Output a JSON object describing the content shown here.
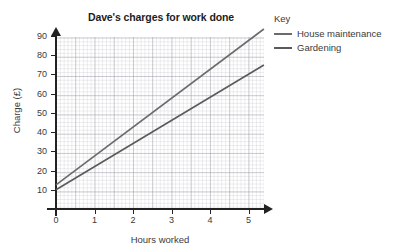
{
  "chart_data": {
    "type": "line",
    "title": "Dave's charges for work done",
    "xlabel": "Hours worked",
    "ylabel": "Charge (£)",
    "xlim": [
      0,
      5.4
    ],
    "ylim": [
      0,
      98
    ],
    "xticks": [
      "0",
      "1",
      "2",
      "3",
      "4",
      "5"
    ],
    "xtick_values": [
      0,
      1,
      2,
      3,
      4,
      5
    ],
    "yticks": [
      "10",
      "20",
      "30",
      "40",
      "50",
      "60",
      "70",
      "80",
      "90"
    ],
    "ytick_values": [
      10,
      20,
      30,
      40,
      50,
      60,
      70,
      80,
      90
    ],
    "grid": true,
    "grid_style": "graph-paper",
    "legend_position": "right",
    "series": [
      {
        "name": "House maintenance",
        "color": "#6b6b6b",
        "intercept": 12.5,
        "slope": 15.0,
        "points": [
          [
            0,
            12.5
          ],
          [
            5.4,
            93.5
          ]
        ]
      },
      {
        "name": "Gardening",
        "color": "#5a5a5a",
        "intercept": 10.0,
        "slope": 12.0,
        "points": [
          [
            0,
            10.0
          ],
          [
            5.4,
            74.8
          ]
        ]
      }
    ]
  },
  "legend": {
    "title": "Key",
    "entries": [
      {
        "label": "House maintenance",
        "color": "#6b6b6b"
      },
      {
        "label": "Gardening",
        "color": "#5a5a5a"
      }
    ]
  },
  "axis_colors": {
    "axis": "#222222",
    "grid_major": "#9699a0",
    "grid_minor": "#aaacb4",
    "text": "#3a3a3a"
  }
}
